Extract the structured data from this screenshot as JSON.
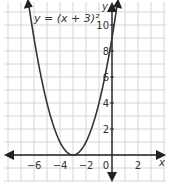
{
  "chart_data": {
    "type": "line",
    "title": "",
    "equation_label": "y = (x + 3)²",
    "xlabel": "x",
    "ylabel": "y",
    "x_ticks": [
      "−6",
      "−4",
      "−2",
      "0",
      "2"
    ],
    "x_tick_values": [
      -6,
      -4,
      -2,
      0,
      2
    ],
    "y_ticks": [
      "2",
      "4",
      "6",
      "8",
      "10"
    ],
    "y_tick_values": [
      2,
      4,
      6,
      8,
      10
    ],
    "xlim": [
      -8.5,
      4.5
    ],
    "ylim": [
      -2,
      12
    ],
    "grid": true,
    "series": [
      {
        "name": "y = (x + 3)^2",
        "function": "(x+3)^2",
        "x": [
          -6.4,
          -6,
          -5,
          -4,
          -3,
          -2,
          -1,
          0,
          0.4
        ],
        "values": [
          11.56,
          9,
          4,
          1,
          0,
          1,
          4,
          9,
          11.56
        ]
      }
    ],
    "vertex": [
      -3,
      0
    ]
  }
}
